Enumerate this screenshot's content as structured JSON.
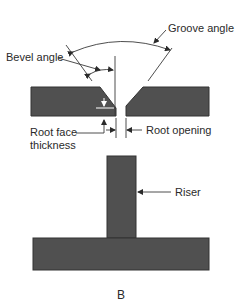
{
  "diagram": {
    "groove": {
      "labels": {
        "groove_angle": "Groove angle",
        "bevel_angle": "Bevel angle",
        "root_face_line1": "Root face",
        "root_face_line2": "thickness",
        "root_opening": "Root opening"
      }
    },
    "tee": {
      "labels": {
        "riser": "Riser"
      }
    },
    "caption": "B",
    "colors": {
      "plate_fill": "#505050",
      "line": "#3a3a3a",
      "text": "#2a2a2a"
    }
  }
}
